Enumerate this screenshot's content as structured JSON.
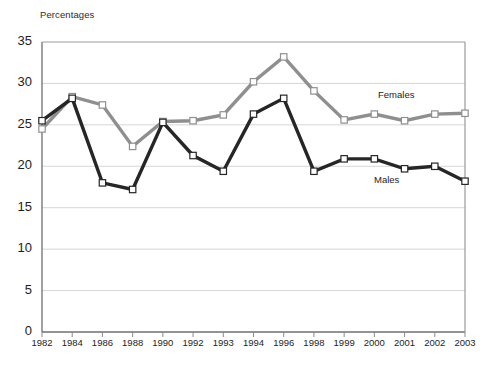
{
  "chart_data": {
    "type": "line",
    "title": "",
    "ylabel": "Percentages",
    "xlabel": "",
    "ylim": [
      0,
      35
    ],
    "yticks": [
      0,
      5,
      10,
      15,
      20,
      25,
      30,
      35
    ],
    "grid": true,
    "legend_position": "inline-annotation",
    "categories": [
      "1982",
      "1984",
      "1986",
      "1988",
      "1990",
      "1992",
      "1993",
      "1994",
      "1996",
      "1998",
      "1999",
      "2000",
      "2001",
      "2002",
      "2003"
    ],
    "series": [
      {
        "name": "Females",
        "color": "#8f8f8f",
        "marker": "square-open",
        "values": [
          24.5,
          28.4,
          27.4,
          22.4,
          25.4,
          25.5,
          26.2,
          30.2,
          33.2,
          29.1,
          25.6,
          26.3,
          25.5,
          26.3,
          26.4
        ]
      },
      {
        "name": "Males",
        "color": "#262626",
        "marker": "square-open",
        "values": [
          25.5,
          28.2,
          18.0,
          17.2,
          25.3,
          21.3,
          19.4,
          26.3,
          28.2,
          19.4,
          20.9,
          20.9,
          19.7,
          20.0,
          18.2
        ]
      }
    ],
    "annotations": [
      {
        "text": "Females",
        "x": "2000",
        "y": 28.0
      },
      {
        "text": "Males",
        "x": "2000",
        "y": 16.6
      }
    ]
  },
  "axes": {
    "plot_left": 42,
    "plot_right": 465,
    "plot_top": 42,
    "plot_bottom": 332,
    "border_color": "#8a8a8a",
    "grid_color": "#d6d6d6"
  }
}
